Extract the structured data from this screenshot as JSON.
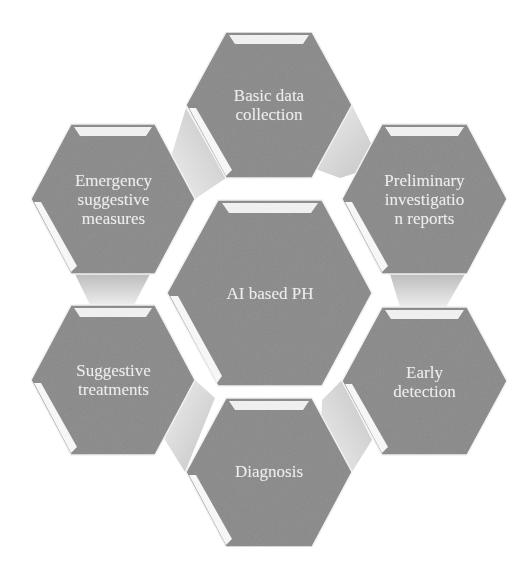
{
  "diagram": {
    "type": "hexagon-cluster",
    "colors": {
      "hex_fill": "#898989",
      "hex_bevel": "#ffffff",
      "connector_light": "#e9e9e9",
      "connector_dark": "#bdbdbd",
      "text": "#ececec"
    },
    "center": {
      "label": "AI based PH",
      "lines": [
        "AI based PH"
      ]
    },
    "nodes": [
      {
        "id": "top",
        "label": "Basic data collection",
        "lines": [
          "Basic data",
          "collection"
        ]
      },
      {
        "id": "upper-right",
        "label": "Preliminary investigation reports",
        "lines": [
          "Preliminary",
          "investigatio",
          "n reports"
        ]
      },
      {
        "id": "lower-right",
        "label": "Early detection",
        "lines": [
          "Early",
          "detection"
        ]
      },
      {
        "id": "bottom",
        "label": "Diagnosis",
        "lines": [
          "Diagnosis"
        ]
      },
      {
        "id": "lower-left",
        "label": "Suggestive treatments",
        "lines": [
          "Suggestive",
          "treatments"
        ]
      },
      {
        "id": "upper-left",
        "label": "Emergency suggestive measures",
        "lines": [
          "Emergency",
          "suggestive",
          "measures"
        ]
      }
    ]
  }
}
